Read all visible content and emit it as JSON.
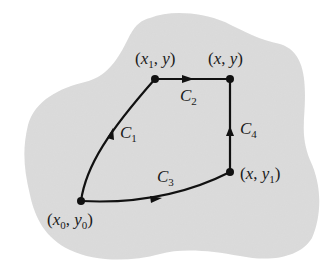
{
  "diagram": {
    "type": "path-independence-region",
    "colors": {
      "region_fill": "#dcdcdc",
      "background": "#ffffff",
      "stroke": "#111111"
    },
    "points": [
      {
        "id": "p0",
        "label_var_x": "x",
        "label_sub_x": "0",
        "label_var_y": "y",
        "label_sub_y": "0",
        "text": "(x0, y0)",
        "x": 81,
        "y": 201
      },
      {
        "id": "p1",
        "label_var_x": "x",
        "label_sub_x": "1",
        "label_var_y": "y",
        "label_sub_y": "",
        "text": "(x1, y)",
        "x": 155,
        "y": 79
      },
      {
        "id": "p2",
        "label_var_x": "x",
        "label_sub_x": "",
        "label_var_y": "y",
        "label_sub_y": "",
        "text": "(x, y)",
        "x": 230,
        "y": 79
      },
      {
        "id": "p3",
        "label_var_x": "x",
        "label_sub_x": "",
        "label_var_y": "y",
        "label_sub_y": "1",
        "text": "(x, y1)",
        "x": 230,
        "y": 172
      }
    ],
    "curves": [
      {
        "id": "C1",
        "letter": "C",
        "sub": "1",
        "from": "p0",
        "to": "p1",
        "shape": "curved"
      },
      {
        "id": "C2",
        "letter": "C",
        "sub": "2",
        "from": "p1",
        "to": "p2",
        "shape": "straight-horizontal"
      },
      {
        "id": "C3",
        "letter": "C",
        "sub": "3",
        "from": "p0",
        "to": "p3",
        "shape": "curved"
      },
      {
        "id": "C4",
        "letter": "C",
        "sub": "4",
        "from": "p3",
        "to": "p2",
        "shape": "straight-vertical"
      }
    ]
  }
}
